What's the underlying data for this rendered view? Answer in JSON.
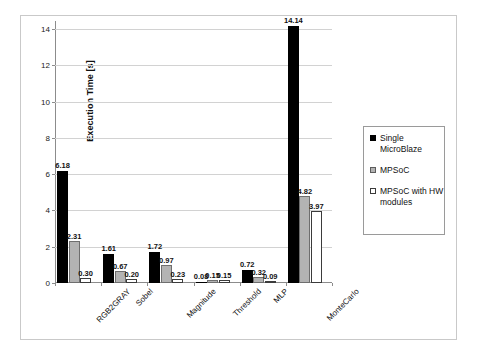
{
  "chart_data": {
    "type": "bar",
    "title": "",
    "xlabel": "",
    "ylabel": "Execution Time [s]",
    "ylim": [
      0,
      14
    ],
    "ytick_labels": [
      "0",
      "2",
      "4",
      "6",
      "8",
      "10",
      "12",
      "14"
    ],
    "ytick_values": [
      0,
      2,
      4,
      6,
      8,
      10,
      12,
      14
    ],
    "grid": true,
    "legend_position": "right",
    "categories": [
      "RGB2GRAY",
      "Sobel",
      "Magnitude",
      "Threshold",
      "MLP",
      "MonteCarlo"
    ],
    "series": [
      {
        "name": "Single MicroBlaze",
        "color": "#000000",
        "values": [
          6.18,
          1.61,
          1.72,
          0.08,
          0.72,
          14.14
        ],
        "labels": [
          "6.18",
          "1.61",
          "1.72",
          "0.08",
          "0.72",
          "14.14"
        ]
      },
      {
        "name": "MPSoC",
        "color": "#b3b3b3",
        "values": [
          2.31,
          0.67,
          0.97,
          0.15,
          0.32,
          4.82
        ],
        "labels": [
          "2.31",
          "0.67",
          "0.97",
          "0.15",
          "0.32",
          "4.82"
        ]
      },
      {
        "name": "MPSoC with HW modules",
        "color": "#ffffff",
        "values": [
          0.3,
          0.2,
          0.23,
          0.15,
          0.09,
          3.97
        ],
        "labels": [
          "0.30",
          "0.20",
          "0.23",
          "0.15",
          "0.09",
          "3.97"
        ]
      }
    ]
  },
  "legend": {
    "entries": [
      {
        "label": "Single MicroBlaze"
      },
      {
        "label": "MPSoC"
      },
      {
        "label": "MPSoC with HW modules"
      }
    ]
  }
}
